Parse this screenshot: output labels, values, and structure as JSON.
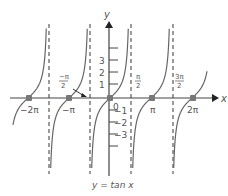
{
  "chart_data": {
    "type": "line",
    "title": "y = tan x",
    "xlabel": "x",
    "ylabel": "y",
    "function": "tan(x)",
    "x_tick_labels": [
      "-2π",
      "-π",
      "0",
      "π",
      "2π"
    ],
    "x_tick_values": [
      -6.2832,
      -3.1416,
      0,
      3.1416,
      6.2832
    ],
    "asymptote_labels": [
      "-π/2",
      "π/2",
      "3π/2"
    ],
    "asymptotes": [
      -4.7124,
      -1.5708,
      1.5708,
      4.7124
    ],
    "y_tick_labels": [
      "3",
      "2",
      "1",
      "-1",
      "-2",
      "-3"
    ],
    "y_tick_values": [
      3,
      2,
      1,
      -1,
      -2,
      -3
    ],
    "zeros": [
      -6.2832,
      -3.1416,
      0,
      3.1416,
      6.2832
    ],
    "ylim": [
      -6,
      6
    ],
    "grid": false,
    "legend": null
  },
  "labels": {
    "y_axis": "y",
    "x_axis": "x",
    "origin": "0",
    "neg_two_pi": "−2π",
    "neg_pi": "−π",
    "pi": "π",
    "two_pi": "2π",
    "neg_half_pi_num": "−π",
    "neg_half_pi_den": "2",
    "half_pi_num": "π",
    "half_pi_den": "2",
    "three_half_pi_num": "3π",
    "three_half_pi_den": "2",
    "y1": "1",
    "y2": "2",
    "y3": "3",
    "yn1": "−1",
    "yn2": "−2",
    "yn3": "−3",
    "caption": "y = tan x"
  },
  "colors": {
    "curve": "#666666",
    "axis": "#444444",
    "point": "#777777",
    "text": "#555555"
  }
}
